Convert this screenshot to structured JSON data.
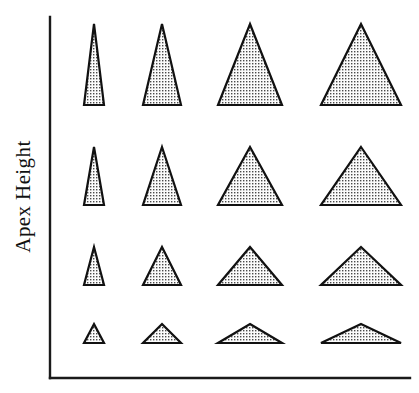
{
  "figure": {
    "title": "",
    "background_color": "#ffffff",
    "width": 419,
    "height": 393
  },
  "axes": {
    "y_label": "Apex Height",
    "x_label": "",
    "y_tick_labels": [],
    "x_tick_labels": [],
    "line_color": "#1a1a1a",
    "origin_x": 50,
    "origin_y": 378,
    "y_axis_top": 17,
    "x_axis_right": 410
  },
  "legend": {
    "visible": false,
    "entries": []
  },
  "chart_data": {
    "type": "scatter",
    "title": "",
    "xlabel": "",
    "ylabel": "Apex Height",
    "grid": false,
    "legend_position": "none",
    "marker_shape": "triangle",
    "fill_pattern": "stipple-grid",
    "fill_color": "#f2f2f2",
    "outline_color": "#111111",
    "xlim": [
      0,
      419
    ],
    "ylim": [
      0,
      393
    ],
    "row_labels": [
      "row-1-tallest",
      "row-2",
      "row-3",
      "row-4-shortest"
    ],
    "column_labels": [
      "col-1-narrowest",
      "col-2",
      "col-3",
      "col-4-widest"
    ],
    "columns": [
      {
        "name": "col-1-narrowest",
        "center_x": 94,
        "base_half_width": 10
      },
      {
        "name": "col-2",
        "center_x": 162,
        "base_half_width": 19
      },
      {
        "name": "col-3",
        "center_x": 250,
        "base_half_width": 32
      },
      {
        "name": "col-4-widest",
        "center_x": 361,
        "base_half_width": 40
      }
    ],
    "rows": [
      {
        "name": "row-1-tallest",
        "baseline_y": 105,
        "apex_height": 81
      },
      {
        "name": "row-2",
        "baseline_y": 205,
        "apex_height": 58
      },
      {
        "name": "row-3",
        "baseline_y": 285,
        "apex_height": 38
      },
      {
        "name": "row-4-shortest",
        "baseline_y": 343,
        "apex_height": 19
      }
    ],
    "triangles": [
      {
        "row": 0,
        "col": 0,
        "apex_x": 94,
        "apex_y": 24,
        "base_left_x": 84,
        "base_right_x": 104,
        "base_y": 105,
        "apex_height": 81,
        "base_width": 20
      },
      {
        "row": 0,
        "col": 1,
        "apex_x": 162,
        "apex_y": 24,
        "base_left_x": 143,
        "base_right_x": 181,
        "base_y": 105,
        "apex_height": 81,
        "base_width": 38
      },
      {
        "row": 0,
        "col": 2,
        "apex_x": 250,
        "apex_y": 24,
        "base_left_x": 218,
        "base_right_x": 282,
        "base_y": 105,
        "apex_height": 81,
        "base_width": 64
      },
      {
        "row": 0,
        "col": 3,
        "apex_x": 361,
        "apex_y": 24,
        "base_left_x": 321,
        "base_right_x": 401,
        "base_y": 105,
        "apex_height": 81,
        "base_width": 80
      },
      {
        "row": 1,
        "col": 0,
        "apex_x": 94,
        "apex_y": 147,
        "base_left_x": 84,
        "base_right_x": 104,
        "base_y": 205,
        "apex_height": 58,
        "base_width": 20
      },
      {
        "row": 1,
        "col": 1,
        "apex_x": 162,
        "apex_y": 147,
        "base_left_x": 143,
        "base_right_x": 181,
        "base_y": 205,
        "apex_height": 58,
        "base_width": 38
      },
      {
        "row": 1,
        "col": 2,
        "apex_x": 250,
        "apex_y": 147,
        "base_left_x": 218,
        "base_right_x": 282,
        "base_y": 205,
        "apex_height": 58,
        "base_width": 64
      },
      {
        "row": 1,
        "col": 3,
        "apex_x": 361,
        "apex_y": 147,
        "base_left_x": 321,
        "base_right_x": 401,
        "base_y": 205,
        "apex_height": 58,
        "base_width": 80
      },
      {
        "row": 2,
        "col": 0,
        "apex_x": 94,
        "apex_y": 247,
        "base_left_x": 84,
        "base_right_x": 104,
        "base_y": 285,
        "apex_height": 38,
        "base_width": 20
      },
      {
        "row": 2,
        "col": 1,
        "apex_x": 162,
        "apex_y": 247,
        "base_left_x": 143,
        "base_right_x": 181,
        "base_y": 285,
        "apex_height": 38,
        "base_width": 38
      },
      {
        "row": 2,
        "col": 2,
        "apex_x": 250,
        "apex_y": 247,
        "base_left_x": 218,
        "base_right_x": 282,
        "base_y": 285,
        "apex_height": 38,
        "base_width": 64
      },
      {
        "row": 2,
        "col": 3,
        "apex_x": 361,
        "apex_y": 247,
        "base_left_x": 321,
        "base_right_x": 401,
        "base_y": 285,
        "apex_height": 38,
        "base_width": 80
      },
      {
        "row": 3,
        "col": 0,
        "apex_x": 94,
        "apex_y": 324,
        "base_left_x": 84,
        "base_right_x": 104,
        "base_y": 343,
        "apex_height": 19,
        "base_width": 20
      },
      {
        "row": 3,
        "col": 1,
        "apex_x": 162,
        "apex_y": 324,
        "base_left_x": 143,
        "base_right_x": 181,
        "base_y": 343,
        "apex_height": 19,
        "base_width": 38
      },
      {
        "row": 3,
        "col": 2,
        "apex_x": 250,
        "apex_y": 324,
        "base_left_x": 218,
        "base_right_x": 282,
        "base_y": 343,
        "apex_height": 19,
        "base_width": 64
      },
      {
        "row": 3,
        "col": 3,
        "apex_x": 361,
        "apex_y": 324,
        "base_left_x": 321,
        "base_right_x": 401,
        "base_y": 343,
        "apex_height": 19,
        "base_width": 80
      }
    ]
  }
}
